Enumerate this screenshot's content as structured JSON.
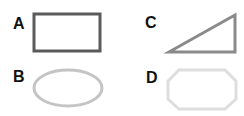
{
  "shapes": [
    {
      "label": "A",
      "type": "rectangle",
      "stroke": "#5a5a5a",
      "stroke_width": 3
    },
    {
      "label": "B",
      "type": "ellipse",
      "stroke": "#c4c4c4",
      "stroke_width": 3
    },
    {
      "label": "C",
      "type": "right-triangle",
      "stroke": "#8a8a8a",
      "stroke_width": 3
    },
    {
      "label": "D",
      "type": "octagon",
      "stroke": "#dedede",
      "stroke_width": 3
    }
  ]
}
